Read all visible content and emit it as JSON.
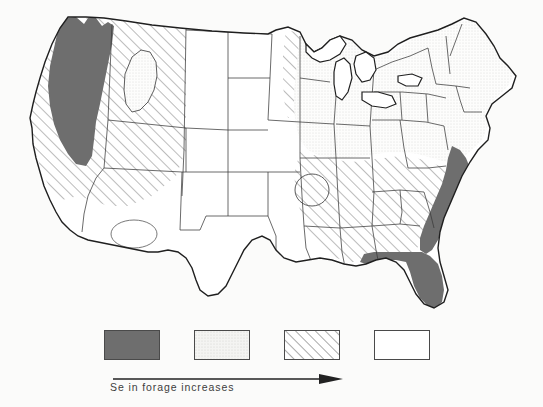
{
  "figure": {
    "type": "choropleth-map",
    "region": "Contiguous United States",
    "background_color": "#fbfbfa",
    "outline_color": "#1f1f1f"
  },
  "legend": {
    "caption": "Se in forage increases",
    "arrow_direction": "right",
    "swatches": [
      {
        "key": "dark",
        "fill": "solid-dark-gray",
        "color": "#6e6e6e",
        "order": 1
      },
      {
        "key": "stipple",
        "fill": "light-stipple",
        "color": "#f0f0ee",
        "order": 2
      },
      {
        "key": "hatch",
        "fill": "diagonal-hatch",
        "color": "#ffffff",
        "order": 3
      },
      {
        "key": "white",
        "fill": "blank-white",
        "color": "#ffffff",
        "order": 4
      }
    ]
  },
  "map_data": {
    "classes": [
      {
        "id": "dark",
        "label": "highest Se in forage",
        "pattern": "solid dark gray"
      },
      {
        "id": "stipple",
        "label": "high Se in forage",
        "pattern": "light stipple"
      },
      {
        "id": "hatch",
        "label": "moderate Se in forage",
        "pattern": "diagonal hatching"
      },
      {
        "id": "white",
        "label": "lowest Se in forage",
        "pattern": "unshaded"
      }
    ],
    "regions": [
      {
        "name": "Pacific Northwest coastal belt",
        "class": "dark"
      },
      {
        "name": "Atlantic coastal plain",
        "class": "dark"
      },
      {
        "name": "Florida peninsula",
        "class": "dark"
      },
      {
        "name": "Upper Midwest and Great Lakes",
        "class": "stipple"
      },
      {
        "name": "Northeast and New England",
        "class": "stipple"
      },
      {
        "name": "Ohio Valley",
        "class": "stipple"
      },
      {
        "name": "Intermountain West",
        "class": "hatch"
      },
      {
        "name": "Northern California and Nevada",
        "class": "hatch"
      },
      {
        "name": "Appalachian and Southeast Piedmont",
        "class": "hatch"
      },
      {
        "name": "Western Minnesota",
        "class": "hatch"
      },
      {
        "name": "Missouri Ozark inlier",
        "class": "hatch"
      },
      {
        "name": "Great Plains",
        "class": "white"
      },
      {
        "name": "Texas and Gulf Coast",
        "class": "white"
      },
      {
        "name": "Desert Southwest",
        "class": "white"
      },
      {
        "name": "Idaho inlier",
        "class": "stipple"
      },
      {
        "name": "Arizona New Mexico inlier",
        "class": "white"
      }
    ]
  }
}
